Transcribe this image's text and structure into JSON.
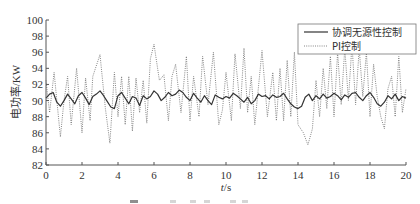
{
  "chart_data": {
    "type": "line",
    "title": "",
    "xlabel": "t/s",
    "ylabel": "电功率/KW",
    "xlim": [
      0,
      20
    ],
    "ylim": [
      82,
      100
    ],
    "xticks": [
      0,
      2,
      4,
      6,
      8,
      10,
      12,
      14,
      16,
      18,
      20
    ],
    "yticks": [
      82,
      84,
      86,
      88,
      90,
      92,
      94,
      96,
      98,
      100
    ],
    "grid": false,
    "legend_position": "upper right",
    "legend": [
      "协调无源性控制",
      "PI控制"
    ],
    "series": [
      {
        "name": "协调无源性控制",
        "style": "solid",
        "color": "#333333",
        "x": [
          0,
          0.2,
          0.4,
          0.6,
          0.8,
          1.0,
          1.2,
          1.4,
          1.6,
          1.8,
          2.0,
          2.2,
          2.4,
          2.6,
          2.8,
          3.0,
          3.2,
          3.4,
          3.6,
          3.8,
          4.0,
          4.2,
          4.4,
          4.6,
          4.8,
          5.0,
          5.2,
          5.4,
          5.6,
          5.8,
          6.0,
          6.2,
          6.4,
          6.6,
          6.8,
          7.0,
          7.2,
          7.4,
          7.6,
          7.8,
          8.0,
          8.2,
          8.4,
          8.6,
          8.8,
          9.0,
          9.2,
          9.4,
          9.6,
          9.8,
          10.0,
          10.2,
          10.4,
          10.6,
          10.8,
          11.0,
          11.2,
          11.4,
          11.6,
          11.8,
          12.0,
          12.2,
          12.4,
          12.6,
          12.8,
          13.0,
          13.2,
          13.4,
          13.6,
          13.8,
          14.0,
          14.2,
          14.4,
          14.6,
          14.8,
          15.0,
          15.2,
          15.4,
          15.6,
          15.8,
          16.0,
          16.2,
          16.4,
          16.6,
          16.8,
          17.0,
          17.2,
          17.4,
          17.6,
          17.8,
          18.0,
          18.2,
          18.4,
          18.6,
          18.8,
          19.0,
          19.2,
          19.4,
          19.6,
          19.8,
          20.0
        ],
        "values": [
          90.3,
          90.8,
          91.0,
          89.8,
          89.3,
          90.0,
          90.8,
          90.2,
          89.6,
          90.6,
          91.0,
          90.3,
          89.5,
          90.5,
          90.8,
          91.2,
          90.6,
          89.9,
          89.2,
          89.0,
          90.6,
          91.0,
          90.3,
          89.6,
          90.5,
          90.3,
          89.4,
          90.6,
          90.2,
          90.5,
          91.2,
          90.8,
          90.0,
          90.4,
          91.0,
          90.6,
          90.8,
          91.3,
          91.0,
          90.4,
          90.0,
          90.9,
          90.3,
          89.8,
          90.6,
          90.0,
          89.5,
          90.7,
          90.4,
          90.2,
          90.5,
          90.3,
          90.9,
          90.6,
          90.2,
          89.8,
          90.4,
          89.6,
          90.0,
          90.8,
          90.5,
          90.6,
          90.2,
          90.7,
          90.4,
          90.5,
          90.9,
          90.2,
          89.6,
          89.2,
          89.0,
          89.3,
          90.4,
          90.8,
          90.0,
          90.6,
          90.2,
          90.8,
          90.3,
          90.5,
          90.9,
          90.6,
          90.1,
          90.7,
          90.4,
          90.9,
          91.0,
          90.4,
          90.0,
          90.6,
          91.0,
          90.4,
          89.6,
          89.3,
          89.8,
          90.6,
          90.2,
          90.8,
          90.0,
          90.5,
          90.3
        ]
      },
      {
        "name": "PI控制",
        "style": "dotted",
        "color": "#777777",
        "x": [
          0,
          0.2,
          0.45,
          0.8,
          1.0,
          1.2,
          1.4,
          1.7,
          2.0,
          2.2,
          2.45,
          2.6,
          3.0,
          3.3,
          3.55,
          3.8,
          4.0,
          4.2,
          4.4,
          4.6,
          4.8,
          5.0,
          5.2,
          5.4,
          5.6,
          5.8,
          6.0,
          6.3,
          6.55,
          6.8,
          7.0,
          7.2,
          7.5,
          7.8,
          8.0,
          8.2,
          8.5,
          8.7,
          9.0,
          9.3,
          9.6,
          9.8,
          10.0,
          10.3,
          10.5,
          10.8,
          11.0,
          11.2,
          11.4,
          11.6,
          12.0,
          12.3,
          12.6,
          12.8,
          13.0,
          13.2,
          13.4,
          13.6,
          13.8,
          14.0,
          14.3,
          14.55,
          14.8,
          15.0,
          15.2,
          15.4,
          15.6,
          15.8,
          16.0,
          16.2,
          16.4,
          16.6,
          16.8,
          17.0,
          17.2,
          17.4,
          17.6,
          17.8,
          18.0,
          18.2,
          18.4,
          18.6,
          18.8,
          19.0,
          19.2,
          19.4,
          19.6,
          19.8,
          20.0
        ],
        "values": [
          92.5,
          88.5,
          93.5,
          85.5,
          90.0,
          93.0,
          87.0,
          94.0,
          86.0,
          92.8,
          87.5,
          93.0,
          95.7,
          89.0,
          84.7,
          93.5,
          88.0,
          93.0,
          87.0,
          93.0,
          86.2,
          92.8,
          88.5,
          92.5,
          87.2,
          95.2,
          97.0,
          92.5,
          93.2,
          87.5,
          93.0,
          94.5,
          88.5,
          95.5,
          87.5,
          93.0,
          88.0,
          95.5,
          89.5,
          96.0,
          87.0,
          88.8,
          93.5,
          87.5,
          95.8,
          89.0,
          96.5,
          88.5,
          93.0,
          87.0,
          96.2,
          88.0,
          93.5,
          87.5,
          94.0,
          87.5,
          95.0,
          88.0,
          96.0,
          87.0,
          86.0,
          84.5,
          86.5,
          92.5,
          88.0,
          94.0,
          89.0,
          95.5,
          88.0,
          96.0,
          89.5,
          96.5,
          90.0,
          97.0,
          89.5,
          96.5,
          90.5,
          96.0,
          88.0,
          94.5,
          90.5,
          88.0,
          86.5,
          91.5,
          93.0,
          88.0,
          95.5,
          88.5,
          91.5
        ]
      }
    ]
  },
  "axes": {
    "xlabel_italic": "t",
    "xlabel_unit": "/s",
    "ylabel": "电功率/KW"
  },
  "legend": {
    "items": [
      {
        "label": "协调无源性控制",
        "style": "solid"
      },
      {
        "label": "PI控制",
        "style": "dotted"
      }
    ]
  }
}
